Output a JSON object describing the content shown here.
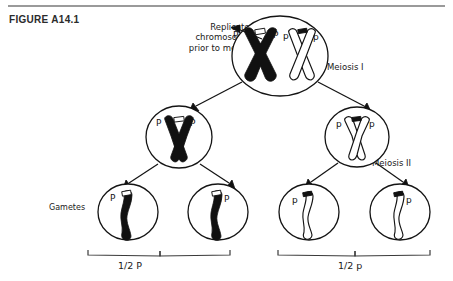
{
  "figure": {
    "label": "FIGURE A14.1",
    "top_rule_color": "#9a9a9a"
  },
  "annotations": {
    "replicated": "Replicated\nchromosomes\nprior to meiosis",
    "meiosis_one": "Meiosis I",
    "meiosis_two": "Meiosis II",
    "gametes": "Gametes"
  },
  "brackets": {
    "left_label": "1/2 P",
    "right_label": "1/2 p"
  },
  "cells": {
    "parent": {
      "name": "parent-cell",
      "alleles": [
        "P",
        "P",
        "p",
        "p"
      ],
      "chromosomes": [
        {
          "type": "x-pair",
          "shade": "dark",
          "alleles": [
            "P",
            "P"
          ]
        },
        {
          "type": "x-pair",
          "shade": "light",
          "alleles": [
            "p",
            "p"
          ]
        }
      ]
    },
    "daughter_left": {
      "name": "daughter-cell-left",
      "alleles": [
        "P",
        "P"
      ],
      "chromosomes": [
        {
          "type": "x-pair",
          "shade": "dark",
          "alleles": [
            "P",
            "P"
          ]
        }
      ]
    },
    "daughter_right": {
      "name": "daughter-cell-right",
      "alleles": [
        "p",
        "p"
      ],
      "chromosomes": [
        {
          "type": "x-pair",
          "shade": "light",
          "alleles": [
            "p",
            "p"
          ]
        }
      ]
    },
    "gametes": [
      {
        "name": "gamete-1",
        "allele": "P",
        "shade": "dark"
      },
      {
        "name": "gamete-2",
        "allele": "P",
        "shade": "dark"
      },
      {
        "name": "gamete-3",
        "allele": "p",
        "shade": "light"
      },
      {
        "name": "gamete-4",
        "allele": "p",
        "shade": "light"
      }
    ]
  },
  "colors": {
    "ink": "#141414",
    "dark_chromatid": "#111111",
    "light_chromatid": "#ffffff",
    "background": "#ffffff"
  }
}
